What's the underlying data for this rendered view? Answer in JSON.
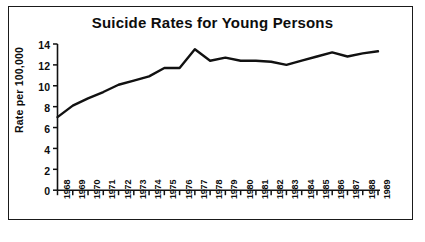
{
  "chart_data": {
    "type": "line",
    "title": "Suicide Rates for Young Persons",
    "xlabel": "",
    "ylabel": "Rate per 100,000",
    "grid": false,
    "legend": false,
    "ylim": [
      0,
      14
    ],
    "ytick_labels": [
      "14",
      "12",
      "10",
      "8",
      "6",
      "4",
      "2",
      "0"
    ],
    "ytick_values": [
      14,
      12,
      10,
      8,
      6,
      4,
      2,
      0
    ],
    "categories": [
      "1968",
      "1969",
      "1970",
      "1971",
      "1972",
      "1973",
      "1974",
      "1975",
      "1976",
      "1977",
      "1978",
      "1979",
      "1980",
      "1981",
      "1982",
      "1983",
      "1984",
      "1985",
      "1986",
      "1987",
      "1988",
      "1989"
    ],
    "values": [
      7.0,
      8.1,
      8.8,
      9.4,
      10.1,
      10.5,
      10.9,
      11.7,
      11.7,
      13.5,
      12.4,
      12.7,
      12.4,
      12.4,
      12.3,
      12.0,
      12.4,
      12.8,
      13.2,
      12.8,
      13.1,
      13.3
    ],
    "series": [
      {
        "name": "Rate per 100,000",
        "color": "#111111",
        "values": [
          7.0,
          8.1,
          8.8,
          9.4,
          10.1,
          10.5,
          10.9,
          11.7,
          11.7,
          13.5,
          12.4,
          12.7,
          12.4,
          12.4,
          12.3,
          12.0,
          12.4,
          12.8,
          13.2,
          12.8,
          13.1,
          13.3
        ]
      }
    ]
  },
  "figure": {
    "background_color": "#ffffff",
    "frame_color": "#1a1a1a",
    "axis_color": "#111111"
  }
}
